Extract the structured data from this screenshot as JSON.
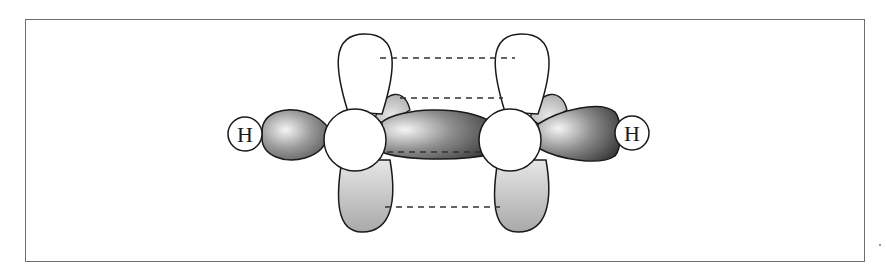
{
  "figure": {
    "type": "molecular-orbital-diagram",
    "atoms": [
      {
        "id": "H1",
        "label": "H",
        "cx": 245,
        "cy": 134,
        "r": 17
      },
      {
        "id": "C1",
        "label": "",
        "cx": 355,
        "cy": 140,
        "r": 31
      },
      {
        "id": "C2",
        "label": "",
        "cx": 510,
        "cy": 140,
        "r": 31
      },
      {
        "id": "H2",
        "label": "H",
        "cx": 632,
        "cy": 133,
        "r": 17
      }
    ],
    "pi_overlap_lines_y": [
      58,
      98,
      152,
      207
    ],
    "colors": {
      "frame": "#6e6e6e",
      "outline": "#1a1a1a",
      "p_lobe_top": "#ffffff",
      "p_lobe_bottom": "#c8c8c8",
      "sigma_dark": "#4a4a4a",
      "sigma_light": "#f2f2f2",
      "dash": "#333333"
    }
  }
}
